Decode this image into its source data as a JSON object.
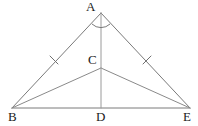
{
  "figure": {
    "type": "geometry-diagram",
    "canvas": {
      "width": 198,
      "height": 126,
      "background": "#ffffff"
    },
    "colors": {
      "line": "#7a7a7a",
      "cevian": "#8a8a8a",
      "altitude": "#9a9a9a",
      "tick": "#6f6f6f",
      "label": "#1a1a1a"
    },
    "points": [
      {
        "id": "A",
        "label": "A",
        "x": 101,
        "y": 13,
        "label_x": 86,
        "label_y": 0
      },
      {
        "id": "C",
        "label": "C",
        "x": 101,
        "y": 68,
        "label_x": 88,
        "label_y": 53
      },
      {
        "id": "B",
        "label": "B",
        "x": 12,
        "y": 108,
        "label_x": 8,
        "label_y": 110
      },
      {
        "id": "D",
        "label": "D",
        "x": 101,
        "y": 108,
        "label_x": 96,
        "label_y": 110
      },
      {
        "id": "E",
        "label": "E",
        "x": 190,
        "y": 108,
        "label_x": 183,
        "label_y": 110
      }
    ],
    "segments": [
      {
        "id": "AB",
        "from": "A",
        "to": "B",
        "name": "segment-ab",
        "style": "edge"
      },
      {
        "id": "AE",
        "from": "A",
        "to": "E",
        "name": "segment-ae",
        "style": "edge"
      },
      {
        "id": "BE",
        "from": "B",
        "to": "E",
        "name": "segment-be",
        "style": "edge"
      },
      {
        "id": "BC",
        "from": "B",
        "to": "C",
        "name": "segment-bc",
        "style": "cevian"
      },
      {
        "id": "CE",
        "from": "C",
        "to": "E",
        "name": "segment-ce",
        "style": "cevian"
      },
      {
        "id": "AD",
        "from": "A",
        "to": "D",
        "name": "segment-ad-altitude",
        "style": "altitude"
      }
    ],
    "tick_marks": [
      {
        "id": "tick-ab",
        "on": "AB",
        "cx": 54,
        "cy": 60,
        "angle_deg": 45
      },
      {
        "id": "tick-ae",
        "on": "AE",
        "cx": 147,
        "cy": 60,
        "angle_deg": -45
      }
    ],
    "angle_marks": [
      {
        "id": "angle-a",
        "at": "A",
        "radius": 12,
        "note": "arc across apex angle BAE bisected by AD"
      }
    ]
  }
}
